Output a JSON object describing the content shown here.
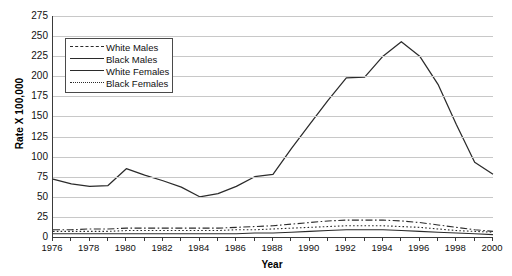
{
  "chart_data": {
    "type": "line",
    "title": "",
    "xlabel": "Year",
    "ylabel": "Rate X 100,000",
    "xlim": [
      1976,
      2000
    ],
    "ylim": [
      0,
      275
    ],
    "y_tick_step": 25,
    "x_tick_step": 2,
    "grid": true,
    "legend_position": "upper-left-inside",
    "x": [
      1976,
      1977,
      1978,
      1979,
      1980,
      1981,
      1982,
      1983,
      1984,
      1985,
      1986,
      1987,
      1988,
      1989,
      1990,
      1991,
      1992,
      1993,
      1994,
      1995,
      1996,
      1997,
      1998,
      1999,
      2000
    ],
    "y_ticks": [
      0,
      25,
      50,
      75,
      100,
      125,
      150,
      175,
      200,
      225,
      250,
      275
    ],
    "x_ticks": [
      1976,
      1978,
      1980,
      1982,
      1984,
      1986,
      1988,
      1990,
      1992,
      1994,
      1996,
      1998,
      2000
    ],
    "series": [
      {
        "name": "White Males",
        "style": "dash-dot",
        "color": "#2b2b2b",
        "values": [
          9,
          9,
          10,
          10,
          11,
          11,
          11,
          11,
          11,
          11,
          12,
          13,
          14,
          16,
          18,
          20,
          21,
          21,
          21,
          20,
          18,
          15,
          12,
          9,
          7
        ]
      },
      {
        "name": "Black Males",
        "style": "solid",
        "color": "#2b2b2b",
        "values": [
          72,
          66,
          63,
          64,
          85,
          77,
          70,
          62,
          50,
          54,
          63,
          75,
          78,
          110,
          140,
          170,
          198,
          199,
          225,
          243,
          225,
          190,
          140,
          93,
          78
        ]
      },
      {
        "name": "White Females",
        "style": "solid",
        "color": "#2b2b2b",
        "values": [
          4,
          4,
          4,
          4,
          4,
          4,
          4,
          4,
          4,
          4,
          4,
          5,
          5,
          6,
          7,
          8,
          9,
          9,
          9,
          8,
          7,
          6,
          5,
          4,
          3
        ]
      },
      {
        "name": "Black Females",
        "style": "dotted",
        "color": "#2b2b2b",
        "values": [
          7,
          7,
          7,
          7,
          8,
          8,
          8,
          8,
          8,
          8,
          9,
          9,
          10,
          11,
          12,
          13,
          14,
          14,
          14,
          13,
          12,
          10,
          8,
          7,
          6
        ]
      }
    ]
  },
  "axis": {
    "y_title": "Rate X 100,000",
    "x_title": "Year"
  },
  "legend": {
    "entries": [
      {
        "label": "White Males"
      },
      {
        "label": "Black Males"
      },
      {
        "label": "White Females"
      },
      {
        "label": "Black Females"
      }
    ]
  },
  "colors": {
    "line": "#2b2b2b",
    "grid": "#c8c8c8",
    "axis": "#3a3a3a",
    "background": "#ffffff",
    "text": "#111111"
  }
}
